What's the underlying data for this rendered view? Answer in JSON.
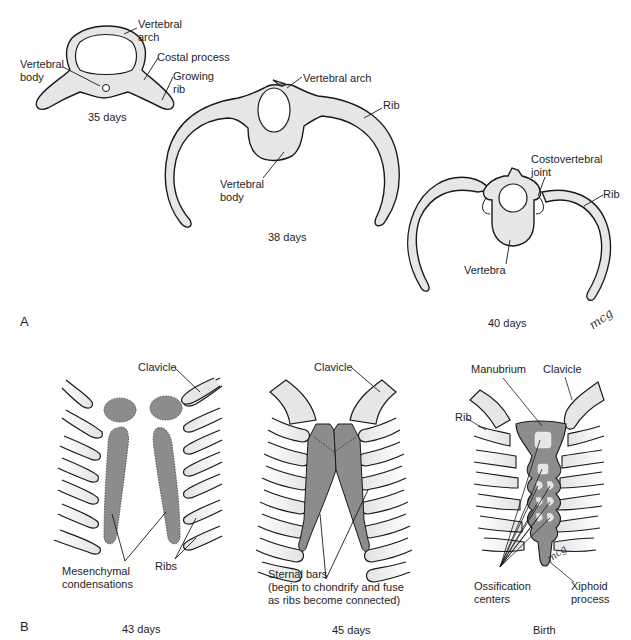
{
  "panels": [
    {
      "id": "A",
      "label": "A",
      "stages": [
        {
          "caption": "35 days",
          "labels": {
            "vertebral_arch": "Vertebral\narch",
            "vertebral_body": "Vertebral\nbody",
            "costal_process": "Costal process",
            "growing_rib": "Growing\nrib"
          }
        },
        {
          "caption": "38 days",
          "labels": {
            "vertebral_arch": "Vertebral arch",
            "rib": "Rib",
            "vertebral_body": "Vertebral\nbody"
          }
        },
        {
          "caption": "40 days",
          "labels": {
            "costovertebral_joint": "Costovertebral\njoint",
            "rib": "Rib",
            "vertebra": "Vertebra"
          },
          "signature": "mcg"
        }
      ]
    },
    {
      "id": "B",
      "label": "B",
      "stages": [
        {
          "caption": "43 days",
          "labels": {
            "clavicle": "Clavicle",
            "mesenchymal_condensations": "Mesenchymal\ncondensations",
            "ribs": "Ribs"
          }
        },
        {
          "caption": "45 days",
          "labels": {
            "clavicle": "Clavicle",
            "sternal_bars": "Sternal bars\n(begin to chondrify and fuse\nas ribs become connected)"
          }
        },
        {
          "caption": "Birth",
          "labels": {
            "manubrium": "Manubrium",
            "clavicle": "Clavicle",
            "rib": "Rib",
            "ossification_centers": "Ossification\ncenters",
            "xiphoid_process": "Xiphoid\nprocess"
          },
          "signature": "mcg"
        }
      ]
    }
  ],
  "colors": {
    "cartilage_fill": "#e6e6e6",
    "mesenchyme_fill": "#8c8c8c",
    "outline": "#1a1a1a",
    "background": "#ffffff"
  }
}
